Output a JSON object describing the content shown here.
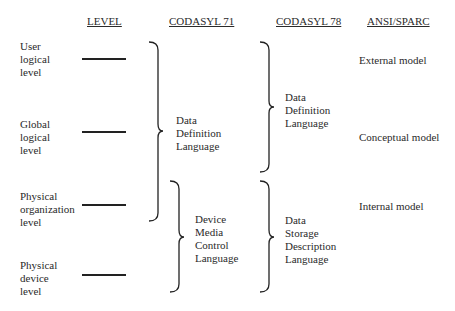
{
  "headers": {
    "level": "LEVEL",
    "codasyl71": "CODASYL 71",
    "codasyl78": "CODASYL 78",
    "ansi": "ANSI/SPARC"
  },
  "levels": [
    {
      "label": "User\nlogical\nlevel"
    },
    {
      "label": "Global\nlogical\nlevel"
    },
    {
      "label": "Physical\norganization\nlevel"
    },
    {
      "label": "Physical\ndevice\nlevel"
    }
  ],
  "codasyl71": [
    {
      "label": "Data\nDefinition\nLanguage",
      "spans": [
        "User logical level",
        "Global logical level",
        "Physical organization level"
      ]
    },
    {
      "label": "Device\nMedia\nControl\nLanguage",
      "spans": [
        "Physical organization level",
        "Physical device level"
      ]
    }
  ],
  "codasyl78": [
    {
      "label": "Data\nDefinition\nLanguage",
      "spans": [
        "User logical level",
        "Global logical level"
      ]
    },
    {
      "label": "Data\nStorage\nDescription\nLanguage",
      "spans": [
        "Physical organization level",
        "Physical device level"
      ]
    }
  ],
  "ansi": [
    {
      "label": "External model"
    },
    {
      "label": "Conceptual model"
    },
    {
      "label": "Internal model"
    }
  ]
}
